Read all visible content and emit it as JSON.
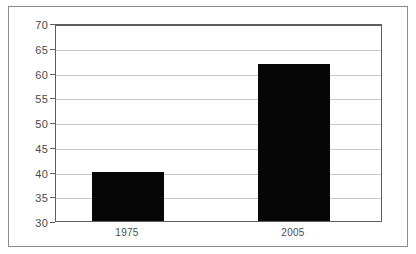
{
  "chart_data": {
    "type": "bar",
    "title": "",
    "subtitle": "",
    "xlabel": "",
    "ylabel": "",
    "categories": [
      "1975",
      "2005"
    ],
    "values": [
      40,
      62
    ],
    "series": [
      {
        "name": "",
        "values": [
          40,
          62
        ]
      }
    ],
    "ylim": [
      30,
      70
    ],
    "ytick_step": 5,
    "yticks": [
      30,
      35,
      40,
      45,
      50,
      55,
      60,
      65,
      70
    ],
    "ytick_labels": [
      "30",
      "35",
      "40",
      "45",
      "50",
      "55",
      "60",
      "65",
      "70"
    ],
    "xticks": [
      "1975",
      "2005"
    ],
    "grid": true,
    "grid_axis": "y",
    "legend": false,
    "legend_position": "none",
    "annotations": [],
    "colors": {
      "bar_fill": "#060606",
      "gridline": "#c9c9c9",
      "axis_line": "#5e5e5e",
      "outer_frame": "#8c8c8c",
      "tick_label": "#4a4a4a",
      "background": "#ffffff"
    }
  }
}
